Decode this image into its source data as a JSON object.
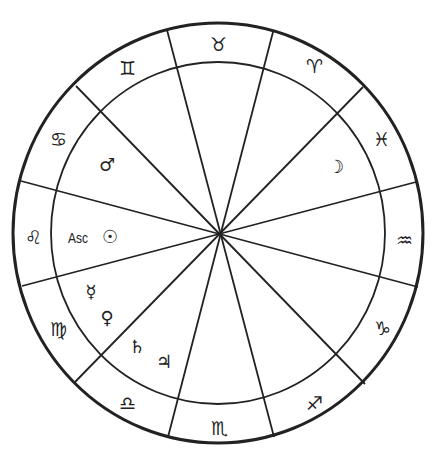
{
  "chart": {
    "type": "natal-wheel",
    "center": [
      218,
      233
    ],
    "outer_ring": {
      "rx": 205,
      "ry": 210
    },
    "inner_ring": {
      "rx": 167,
      "ry": 171
    },
    "line_color": "#222222"
  },
  "signs": [
    {
      "name": "taurus",
      "symbol": "♉",
      "x": 218,
      "y": 44
    },
    {
      "name": "aries",
      "symbol": "♈",
      "x": 314,
      "y": 66
    },
    {
      "name": "pisces",
      "symbol": "♓",
      "x": 381,
      "y": 139
    },
    {
      "name": "aquarius",
      "symbol": "♒",
      "x": 404,
      "y": 240
    },
    {
      "name": "capricorn",
      "symbol": "♑",
      "x": 382,
      "y": 328
    },
    {
      "name": "sagittarius",
      "symbol": "♐",
      "x": 314,
      "y": 403
    },
    {
      "name": "scorpio",
      "symbol": "♏",
      "x": 219,
      "y": 428
    },
    {
      "name": "libra",
      "symbol": "♎",
      "x": 127,
      "y": 403
    },
    {
      "name": "virgo",
      "symbol": "♍",
      "x": 58,
      "y": 329
    },
    {
      "name": "leo",
      "symbol": "♌",
      "x": 33,
      "y": 237
    },
    {
      "name": "cancer",
      "symbol": "♋",
      "x": 58,
      "y": 139
    },
    {
      "name": "gemini",
      "symbol": "♊",
      "x": 127,
      "y": 68
    }
  ],
  "planets": [
    {
      "name": "mars",
      "symbol": "♂",
      "x": 107,
      "y": 165
    },
    {
      "name": "moon",
      "symbol": "☽",
      "x": 336,
      "y": 167
    },
    {
      "name": "sun",
      "symbol": "☉",
      "x": 110,
      "y": 237
    },
    {
      "name": "mercury",
      "symbol": "☿",
      "x": 91,
      "y": 292
    },
    {
      "name": "venus",
      "symbol": "♀",
      "x": 107,
      "y": 318
    },
    {
      "name": "saturn",
      "symbol": "♄",
      "x": 137,
      "y": 347
    },
    {
      "name": "jupiter",
      "symbol": "♃",
      "x": 164,
      "y": 362
    }
  ],
  "ascendant": {
    "label": "Asc",
    "x": 78,
    "y": 237
  },
  "house_lines": [
    [
      167,
      30,
      274,
      437
    ],
    [
      273,
      32,
      168,
      437
    ],
    [
      76,
      86,
      365,
      384
    ],
    [
      363,
      87,
      75,
      382
    ],
    [
      21,
      181,
      418,
      287
    ],
    [
      416,
      182,
      22,
      286
    ]
  ]
}
